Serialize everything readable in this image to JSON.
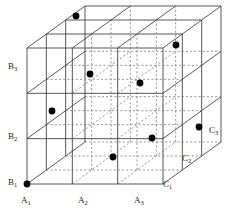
{
  "figure": {
    "name": "three-factor-design-cube",
    "type": "3d-lattice-cube",
    "background_color": "#ffffff",
    "line_color": "#3a3a3a",
    "dashed_color": "#6e6e6e",
    "point_color": "#000000",
    "label_color": "#1a1a1a"
  },
  "geometry": {
    "origin_x": 27,
    "origin_y": 184,
    "width": 136,
    "height": 136,
    "depth_dx": 58,
    "depth_dy": -42,
    "divisions": 3
  },
  "axes": {
    "x": {
      "name": "A",
      "labels": [
        {
          "text": "A",
          "sub": "1",
          "x": 21,
          "y": 196
        },
        {
          "text": "A",
          "sub": "2",
          "x": 78,
          "y": 196
        },
        {
          "text": "A",
          "sub": "3",
          "x": 134,
          "y": 196
        }
      ]
    },
    "y": {
      "name": "B",
      "labels": [
        {
          "text": "B",
          "sub": "1",
          "x": 8,
          "y": 178
        },
        {
          "text": "B",
          "sub": "2",
          "x": 8,
          "y": 132
        },
        {
          "text": "B",
          "sub": "3",
          "x": 8,
          "y": 62
        }
      ]
    },
    "z": {
      "name": "C",
      "labels": [
        {
          "text": "C",
          "sub": "1",
          "x": 163,
          "y": 180
        },
        {
          "text": "C",
          "sub": "2",
          "x": 182,
          "y": 154
        },
        {
          "text": "C",
          "sub": "3",
          "x": 209,
          "y": 126
        }
      ]
    }
  },
  "chart_data": {
    "type": "scatter",
    "title": "",
    "xlabel": "A",
    "ylabel": "B",
    "zlabel": "C",
    "categories_x": [
      "A1",
      "A2",
      "A3"
    ],
    "categories_y": [
      "B1",
      "B2",
      "B3"
    ],
    "categories_z": [
      "C1",
      "C2",
      "C3"
    ],
    "points": [
      {
        "label": "A1 B1 C1",
        "a": 0,
        "b": 0,
        "c": 0,
        "px": 27,
        "py": 184
      },
      {
        "label": "A1 B2 C2",
        "a": 0,
        "b": 1,
        "c": 1,
        "px": 52,
        "py": 111
      },
      {
        "label": "A1 B3 C3",
        "a": 0,
        "b": 2,
        "c": 2,
        "px": 76,
        "py": 16
      },
      {
        "label": "A2 B1 C2",
        "a": 1,
        "b": 0,
        "c": 1,
        "px": 113,
        "py": 157
      },
      {
        "label": "A2 B3 C1",
        "a": 1,
        "b": 2,
        "c": 0,
        "px": 90,
        "py": 74
      },
      {
        "label": "A2 B3 C2",
        "a": 1,
        "b": 2,
        "c": 1,
        "px": 140,
        "py": 83
      },
      {
        "label": "A3 B2 C1",
        "a": 2,
        "b": 1,
        "c": 0,
        "px": 152,
        "py": 138
      },
      {
        "label": "A3 B3 C3",
        "a": 2,
        "b": 2,
        "c": 2,
        "px": 176,
        "py": 45
      },
      {
        "label": "A3 B1 C3",
        "a": 2,
        "b": 0,
        "c": 2,
        "px": 199,
        "py": 127
      }
    ],
    "point_radius": 3.4,
    "grid": true,
    "legend": false
  }
}
